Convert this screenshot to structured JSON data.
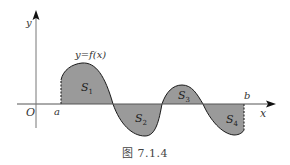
{
  "figure": {
    "caption": "图 7.1.4",
    "curve_label": "y=f(x)",
    "axes": {
      "x_label": "x",
      "y_label": "y",
      "origin_label": "O"
    },
    "bounds": {
      "a_label": "a",
      "b_label": "b"
    },
    "regions": [
      {
        "name": "S",
        "sub": "1",
        "sign": "above"
      },
      {
        "name": "S",
        "sub": "2",
        "sign": "below"
      },
      {
        "name": "S",
        "sub": "3",
        "sign": "above"
      },
      {
        "name": "S",
        "sub": "4",
        "sign": "below"
      }
    ],
    "colors": {
      "fill": "#9a9a9a",
      "stroke": "#1a1a1a",
      "axis": "#555555"
    }
  }
}
